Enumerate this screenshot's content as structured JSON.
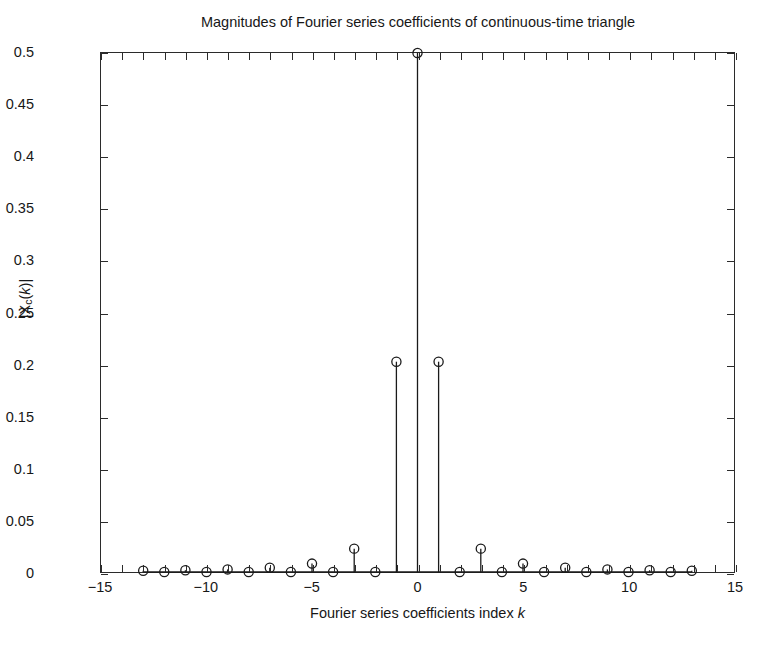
{
  "chart_data": {
    "type": "scatter",
    "plot_style": "stem",
    "title": "Magnitudes of Fourier series coefficients of continuous-time triangle",
    "xlabel": "Fourier series coefficients index k",
    "xlabel_plain": "Fourier series coefficients index",
    "xlabel_italic_var": "k",
    "ylabel": "|Xc(k)|",
    "ylabel_parts": {
      "pre": "|X",
      "sub": "c",
      "mid": "(",
      "var": "k",
      "post": ")|"
    },
    "xlim": [
      -15,
      15
    ],
    "ylim": [
      0,
      0.5
    ],
    "xticks": [
      -15,
      -10,
      -5,
      0,
      5,
      10,
      15
    ],
    "xtick_labels": [
      "−15",
      "−10",
      "−5",
      "0",
      "5",
      "10",
      "15"
    ],
    "yticks": [
      0,
      0.05,
      0.1,
      0.15,
      0.2,
      0.25,
      0.3,
      0.35,
      0.4,
      0.45,
      0.5
    ],
    "ytick_labels": [
      "0",
      "0.05",
      "0.1",
      "0.15",
      "0.2",
      "0.25",
      "0.3",
      "0.35",
      "0.4",
      "0.45",
      "0.5"
    ],
    "minor_xticks": [
      -14,
      -13,
      -12,
      -11,
      -9,
      -8,
      -7,
      -6,
      -4,
      -3,
      -2,
      -1,
      1,
      2,
      3,
      4,
      6,
      7,
      8,
      9,
      11,
      12,
      13,
      14
    ],
    "grid": false,
    "legend": false,
    "marker": "circle-open",
    "line_color": "#1a1a1a",
    "background_color": "#ffffff",
    "x": [
      -13,
      -12,
      -11,
      -10,
      -9,
      -8,
      -7,
      -6,
      -5,
      -4,
      -3,
      -2,
      -1,
      0,
      1,
      2,
      3,
      4,
      5,
      6,
      7,
      8,
      9,
      10,
      11,
      12,
      13
    ],
    "values": [
      0.0012,
      0.0,
      0.0017,
      0.0,
      0.0025,
      0.0,
      0.0041,
      0.0,
      0.0081,
      0.0,
      0.0225,
      0.0,
      0.2026,
      0.5,
      0.2026,
      0.0,
      0.0225,
      0.0,
      0.0081,
      0.0,
      0.0041,
      0.0,
      0.0025,
      0.0,
      0.0017,
      0.0,
      0.0012
    ]
  },
  "figure": {
    "axis_color": "#2b2b2b",
    "text_color": "#171717"
  }
}
